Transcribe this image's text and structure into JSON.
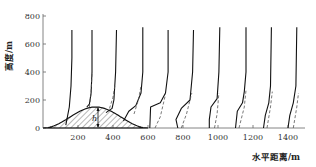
{
  "chart_data": {
    "type": "line",
    "title": "",
    "xlabel": "水平距离/m",
    "ylabel": "高度/m",
    "xlim": [
      0,
      1500
    ],
    "ylim": [
      0,
      800
    ],
    "x_ticks": [
      "200",
      "400",
      "600",
      "800",
      "1000",
      "1200",
      "1400"
    ],
    "y_ticks": [
      "0",
      "200",
      "400",
      "600",
      "800"
    ],
    "grid": false,
    "legend": "none",
    "annotations": [
      {
        "text": "h",
        "note": "hill height marker at hill crest (~310 m)"
      }
    ],
    "terrain": {
      "name": "hill (hatched)",
      "x": [
        0,
        100,
        200,
        300,
        400,
        500,
        600
      ],
      "y": [
        0,
        25,
        110,
        150,
        110,
        30,
        0
      ]
    },
    "series": [
      {
        "name": "profile-1 (solid)",
        "x_base": 130,
        "points": [
          [
            130,
            20
          ],
          [
            150,
            150
          ],
          [
            160,
            300
          ],
          [
            165,
            500
          ],
          [
            165,
            700
          ]
        ]
      },
      {
        "name": "profile-2 (solid)",
        "x_base": 270,
        "points": [
          [
            250,
            150
          ],
          [
            265,
            170
          ],
          [
            275,
            250
          ],
          [
            280,
            400
          ],
          [
            280,
            700
          ]
        ]
      },
      {
        "name": "profile-2 (dashed)",
        "x_base": 270,
        "points": [
          [
            265,
            150
          ],
          [
            275,
            250
          ],
          [
            280,
            400
          ]
        ]
      },
      {
        "name": "profile-3 (solid)",
        "x_base": 420,
        "points": [
          [
            360,
            110
          ],
          [
            395,
            140
          ],
          [
            405,
            200
          ],
          [
            415,
            400
          ],
          [
            420,
            700
          ]
        ]
      },
      {
        "name": "profile-3 (dashed)",
        "x_base": 420,
        "points": [
          [
            380,
            140
          ],
          [
            400,
            220
          ],
          [
            410,
            300
          ]
        ]
      },
      {
        "name": "profile-4 (solid)",
        "x_base": 570,
        "points": [
          [
            460,
            50
          ],
          [
            490,
            120
          ],
          [
            530,
            160
          ],
          [
            560,
            250
          ],
          [
            570,
            400
          ],
          [
            570,
            720
          ]
        ]
      },
      {
        "name": "profile-4 (dashed)",
        "x_base": 570,
        "points": [
          [
            520,
            100
          ],
          [
            545,
            200
          ],
          [
            560,
            300
          ]
        ]
      },
      {
        "name": "profile-5 (solid)",
        "x_base": 720,
        "points": [
          [
            610,
            0
          ],
          [
            615,
            150
          ],
          [
            670,
            180
          ],
          [
            700,
            250
          ],
          [
            715,
            400
          ],
          [
            715,
            700
          ]
        ]
      },
      {
        "name": "profile-5 (dashed)",
        "x_base": 720,
        "points": [
          [
            640,
            0
          ],
          [
            670,
            80
          ],
          [
            700,
            240
          ]
        ]
      },
      {
        "name": "profile-6 (solid)",
        "x_base": 860,
        "points": [
          [
            770,
            0
          ],
          [
            760,
            60
          ],
          [
            790,
            140
          ],
          [
            840,
            200
          ],
          [
            855,
            400
          ],
          [
            860,
            700
          ]
        ]
      },
      {
        "name": "profile-6 (dashed)",
        "x_base": 860,
        "points": [
          [
            790,
            0
          ],
          [
            820,
            100
          ],
          [
            850,
            250
          ]
        ]
      },
      {
        "name": "profile-7 (solid)",
        "x_base": 1010,
        "points": [
          [
            950,
            0
          ],
          [
            950,
            60
          ],
          [
            960,
            150
          ],
          [
            995,
            210
          ],
          [
            1005,
            400
          ],
          [
            1010,
            720
          ]
        ]
      },
      {
        "name": "profile-7 (dashed)",
        "x_base": 1010,
        "points": [
          [
            980,
            0
          ],
          [
            995,
            100
          ],
          [
            1005,
            250
          ]
        ]
      },
      {
        "name": "profile-8 (solid)",
        "x_base": 1160,
        "points": [
          [
            1100,
            0
          ],
          [
            1110,
            120
          ],
          [
            1140,
            180
          ],
          [
            1150,
            260
          ],
          [
            1160,
            400
          ],
          [
            1160,
            720
          ]
        ]
      },
      {
        "name": "profile-8 (dashed)",
        "x_base": 1160,
        "points": [
          [
            1120,
            0
          ],
          [
            1150,
            150
          ],
          [
            1160,
            270
          ]
        ]
      },
      {
        "name": "profile-9 (solid)",
        "x_base": 1300,
        "points": [
          [
            1260,
            0
          ],
          [
            1270,
            90
          ],
          [
            1290,
            180
          ],
          [
            1300,
            300
          ],
          [
            1305,
            720
          ]
        ]
      },
      {
        "name": "profile-9 (dashed)",
        "x_base": 1300,
        "points": [
          [
            1280,
            0
          ],
          [
            1300,
            150
          ],
          [
            1310,
            260
          ]
        ]
      },
      {
        "name": "profile-10 (solid)",
        "x_base": 1450,
        "points": [
          [
            1400,
            0
          ],
          [
            1410,
            90
          ],
          [
            1430,
            180
          ],
          [
            1445,
            300
          ],
          [
            1450,
            720
          ]
        ]
      },
      {
        "name": "profile-10 (dashed)",
        "x_base": 1450,
        "points": [
          [
            1430,
            0
          ],
          [
            1450,
            150
          ],
          [
            1460,
            250
          ]
        ]
      }
    ]
  }
}
